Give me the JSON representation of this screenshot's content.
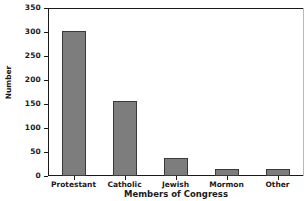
{
  "chart_data": {
    "type": "bar",
    "title": "",
    "categories": [
      "Protestant",
      "Catholic",
      "Jewish",
      "Mormon",
      "Other"
    ],
    "values": [
      303,
      156,
      38,
      14,
      14
    ],
    "xlabel": "Members of Congress",
    "ylabel": "Number",
    "ylim": [
      0,
      350
    ],
    "yticks": [
      0,
      50,
      100,
      150,
      200,
      250,
      300,
      350
    ],
    "ytick_labels": [
      "0",
      "50",
      "100",
      "150",
      "200",
      "250",
      "300",
      "350"
    ],
    "grid": false,
    "legend": null,
    "bar_color": "#7d7d7d",
    "bar_edge_color": "#3a3a3a",
    "background_color": "#ffffff",
    "axis_color": "#1a1a1a"
  }
}
